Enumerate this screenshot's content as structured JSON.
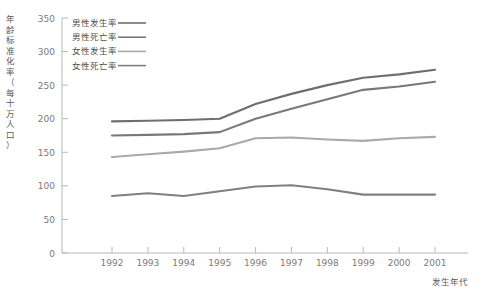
{
  "chart_data": {
    "type": "line",
    "title": "",
    "xlabel": "发生年代",
    "ylabel": "年龄标准化率（每十万人口）",
    "categories": [
      "1992",
      "1993",
      "1994",
      "1995",
      "1996",
      "1997",
      "1998",
      "1999",
      "2000",
      "2001"
    ],
    "x": [
      1992,
      1993,
      1994,
      1995,
      1996,
      1997,
      1998,
      1999,
      2000,
      2001
    ],
    "ylim": [
      0,
      350
    ],
    "yticks": [
      0,
      50,
      100,
      150,
      200,
      250,
      300,
      350
    ],
    "grid": false,
    "legend_position": "top-left inside plot",
    "series": [
      {
        "name": "男性发生率",
        "color": "#6e6e6e",
        "values": [
          196,
          197,
          198,
          200,
          222,
          237,
          250,
          261,
          266,
          273
        ]
      },
      {
        "name": "男性死亡率",
        "color": "#787878",
        "values": [
          175,
          176,
          177,
          180,
          200,
          215,
          229,
          243,
          248,
          255
        ]
      },
      {
        "name": "女性发生率",
        "color": "#a9a9a9",
        "values": [
          143,
          147,
          151,
          156,
          171,
          172,
          169,
          167,
          171,
          173
        ]
      },
      {
        "name": "女性死亡率",
        "color": "#808080",
        "values": [
          85,
          89,
          85,
          92,
          99,
          101,
          95,
          87,
          87,
          87
        ]
      }
    ]
  },
  "axes": {
    "y_tick_labels": [
      "350",
      "300",
      "250",
      "200",
      "150",
      "100",
      "50",
      "0"
    ],
    "x_tick_labels": [
      "1992",
      "1993",
      "1994",
      "1995",
      "1996",
      "1997",
      "1998",
      "1999",
      "2000",
      "2001"
    ],
    "x_axis_title": "发生年代",
    "y_axis_title_chars": [
      "年",
      "龄",
      "标",
      "准",
      "化",
      "率",
      "（",
      "每",
      "十",
      "万",
      "人",
      "口",
      "）"
    ]
  },
  "legend": {
    "items": [
      {
        "label": "男性发生率",
        "color": "#6e6e6e"
      },
      {
        "label": "男性死亡率",
        "color": "#787878"
      },
      {
        "label": "女性发生率",
        "color": "#a9a9a9"
      },
      {
        "label": "女性死亡率",
        "color": "#808080"
      }
    ]
  },
  "style": {
    "axis_color": "#b8b8b8",
    "text_color": "#7a7a7a",
    "background": "#ffffff"
  }
}
